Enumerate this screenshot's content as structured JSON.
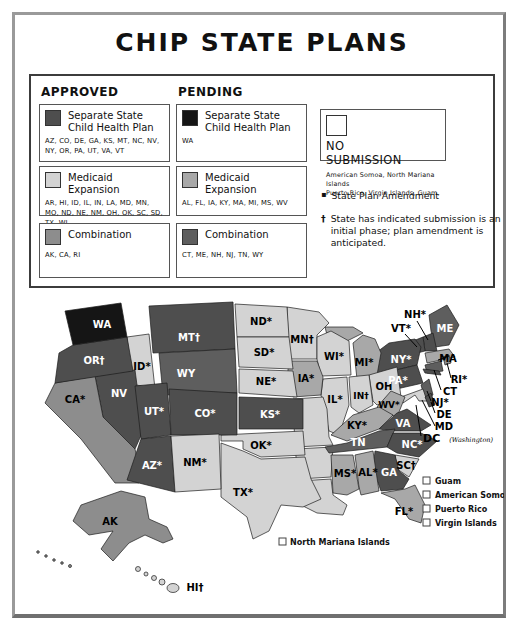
{
  "title": "CHIP STATE PLANS",
  "palette": {
    "approved_separate": "#4e4e4e",
    "approved_medicaid": "#d3d3d3",
    "approved_combination": "#8d8d8d",
    "pending_separate": "#151515",
    "pending_medicaid": "#a8a8a8",
    "pending_combination": "#5e5e5e",
    "no_submission": "#ffffff"
  },
  "legend": {
    "columns": [
      {
        "header": "APPROVED",
        "boxes": [
          {
            "category": "approved_separate",
            "label": "Separate State Child Health Plan",
            "states": "AZ, CO, DE, GA, KS, MT, NC, NV, NY, OR, PA, UT, VA, VT"
          },
          {
            "category": "approved_medicaid",
            "label": "Medicaid Expansion",
            "states": "AR, HI, ID, IL, IN, LA, MD, MN, MO, ND, NE, NM, OH, OK, SC, SD, TX, WI"
          },
          {
            "category": "approved_combination",
            "label": "Combination",
            "states": "AK, CA, RI"
          }
        ]
      },
      {
        "header": "PENDING",
        "boxes": [
          {
            "category": "pending_separate",
            "label": "Separate State Child Health Plan",
            "states": "WA"
          },
          {
            "category": "pending_medicaid",
            "label": "Medicaid Expansion",
            "states": "AL, FL, IA, KY, MA, MI, MS, WV"
          },
          {
            "category": "pending_combination",
            "label": "Combination",
            "states": "CT, ME, NH, NJ, TN, WY"
          }
        ]
      }
    ],
    "no_submission": {
      "label": "NO SUBMISSION",
      "lines": [
        "American Somoa, North Mariana Islands",
        "Puerto Rico, Virgin Islands, Guam,"
      ]
    },
    "notes": [
      {
        "marker": "▪",
        "text": "State Plan Amendment"
      },
      {
        "marker": "†",
        "text": "State has indicated submission is an initial phase; plan amendment is anticipated."
      }
    ]
  },
  "map": {
    "state_labels": {
      "WA": "WA",
      "OR": "OR†",
      "CA": "CA*",
      "NV": "NV",
      "ID": "ID*",
      "MT": "MT†",
      "WY": "WY",
      "UT": "UT*",
      "CO": "CO*",
      "AZ": "AZ*",
      "NM": "NM*",
      "ND": "ND*",
      "SD": "SD*",
      "NE": "NE*",
      "KS": "KS*",
      "OK": "OK*",
      "TX": "TX*",
      "MN": "MN†",
      "IA": "IA*",
      "WI": "WI*",
      "IL": "IL*",
      "IN": "IN†",
      "OH": "OH",
      "MI": "MI*",
      "KY": "KY*",
      "TN": "TN",
      "MS": "MS*",
      "AL": "AL*",
      "GA": "GA",
      "FL": "FL*",
      "SC": "SC†",
      "NC": "NC*",
      "VA": "VA",
      "WV": "WV*",
      "PA": "PA*",
      "NY": "NY*",
      "ME": "ME",
      "AK": "AK",
      "HI": "HI†",
      "NH": "NH*",
      "VT": "VT*",
      "MA": "MA",
      "RI": "RI*",
      "CT": "CT",
      "NJ": "NJ*",
      "DE": "DE",
      "MD": "MD"
    },
    "dc_label": "DC",
    "dc_sub": "(Washington)",
    "territories": [
      "Guam",
      "American Somoa",
      "Puerto Rico",
      "Virgin Islands"
    ],
    "territory_floating": "North Mariana Islands"
  }
}
